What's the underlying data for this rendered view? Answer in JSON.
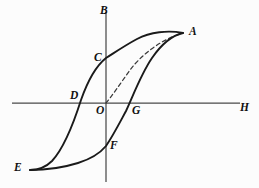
{
  "figure": {
    "kind": "hysteresis-loop",
    "background_color": "#fcfcfc",
    "curve_color": "#1a1a1a",
    "axis_color": "#4a4a4a",
    "dashed_curve_color": "#3a3a3a"
  },
  "axes": {
    "vertical": {
      "label": "B",
      "label_x": 100,
      "label_y": 5,
      "x": 106,
      "y_top": 12,
      "y_bottom": 182
    },
    "horizontal": {
      "label": "H",
      "label_x": 240,
      "label_y": 102,
      "y": 103,
      "x_left": 12,
      "x_right": 240
    }
  },
  "points": [
    {
      "id": "A",
      "label": "A",
      "label_x": 189,
      "label_y": 26,
      "px": 183,
      "py": 33,
      "role": "positive-saturation"
    },
    {
      "id": "B",
      "label": "B",
      "label_x": 100,
      "label_y": 5,
      "px": 106,
      "py": 12,
      "role": "axis-name"
    },
    {
      "id": "C",
      "label": "C",
      "label_x": 94,
      "label_y": 52,
      "px": 106,
      "py": 58,
      "role": "positive-remanence"
    },
    {
      "id": "D",
      "label": "D",
      "label_x": 70,
      "label_y": 90,
      "px": 80,
      "py": 103,
      "role": "negative-coercivity"
    },
    {
      "id": "E",
      "label": "E",
      "label_x": 14,
      "label_y": 162,
      "px": 30,
      "py": 170,
      "role": "negative-saturation"
    },
    {
      "id": "F",
      "label": "F",
      "label_x": 110,
      "label_y": 140,
      "px": 106,
      "py": 146,
      "role": "negative-remanence"
    },
    {
      "id": "G",
      "label": "G",
      "label_x": 132,
      "label_y": 105,
      "px": 130,
      "py": 103,
      "role": "positive-coercivity"
    },
    {
      "id": "H",
      "label": "H",
      "label_x": 240,
      "label_y": 102,
      "px": 240,
      "py": 103,
      "role": "axis-name"
    },
    {
      "id": "O",
      "label": "O",
      "label_x": 96,
      "label_y": 105,
      "px": 106,
      "py": 103,
      "role": "origin"
    }
  ],
  "curves": {
    "virgin": {
      "name": "initial-magnetization-curve",
      "style": "dashed",
      "path": "M 106 103 C 112 96 120 84 130 70 C 142 54 162 39 183 33"
    },
    "descending": {
      "name": "descending-branch-A-C-D-E",
      "style": "solid",
      "path": "M 183 33 C 168 30 150 32 137 39 C 124 46 114 53 106 58 C 96 66 88 80 81 100 C 74 122 64 148 52 161 C 45 168 36 170 30 170"
    },
    "ascending": {
      "name": "ascending-branch-E-F-G-A",
      "style": "solid",
      "path": "M 30 170 C 42 170 62 168 78 163 C 94 158 101 152 106 146 C 114 134 120 122 126 111 C 133 96 141 74 152 58 C 163 42 174 35 183 33"
    }
  }
}
